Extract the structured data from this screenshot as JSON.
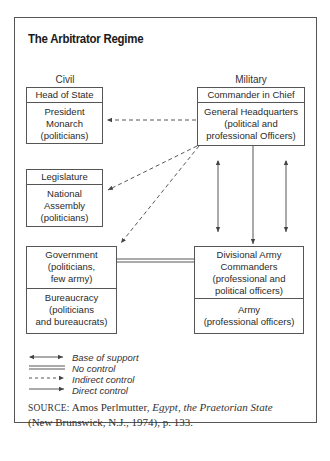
{
  "title": "The Arbitrator Regime",
  "columns": {
    "civil": "Civil",
    "military": "Military"
  },
  "civil_boxes": {
    "head_of_state": {
      "header": "Head of State",
      "body": [
        "President",
        "Monarch",
        "(politicians)"
      ]
    },
    "legislature": {
      "header": "Legislature",
      "body": [
        "National",
        "Assembly",
        "(politicians)"
      ]
    },
    "government": {
      "top": [
        "Government",
        "(politicians,",
        "few army)"
      ],
      "bottom": [
        "Bureaucracy",
        "(politicians",
        "and bureaucrats)"
      ]
    }
  },
  "military_boxes": {
    "commander": {
      "header": "Commander in Chief",
      "body": [
        "General Headquarters",
        "(political and",
        "professional Officers)"
      ]
    },
    "divisional": {
      "top": [
        "Divisional Army",
        "Commanders",
        "(professional and",
        "political officers)"
      ],
      "bottom": [
        "Army",
        "(professional officers)"
      ]
    }
  },
  "connections": [
    {
      "from": "General Headquarters",
      "to": "Head of State",
      "type": "indirect"
    },
    {
      "from": "General Headquarters",
      "to": "Legislature",
      "type": "indirect"
    },
    {
      "from": "General Headquarters",
      "to": "Government",
      "type": "indirect"
    },
    {
      "from": "General Headquarters",
      "to": "Divisional Army Commanders",
      "type": "direct"
    },
    {
      "from": "General Headquarters",
      "to": "Divisional Army Commanders",
      "type": "base_of_support",
      "count": 2
    },
    {
      "from": "Government",
      "to": "Divisional Army Commanders",
      "type": "no_control"
    }
  ],
  "legend": [
    {
      "type": "base_of_support",
      "label": "Base of support"
    },
    {
      "type": "no_control",
      "label": "No control"
    },
    {
      "type": "indirect",
      "label": "Indirect control"
    },
    {
      "type": "direct",
      "label": "Direct control"
    }
  ],
  "source": {
    "prefix": "SOURCE:",
    "author": "Amos Perlmutter,",
    "book": "Egypt, the Praetorian State",
    "rest": "(New Brunswick, N.J., 1974), p. 133."
  }
}
